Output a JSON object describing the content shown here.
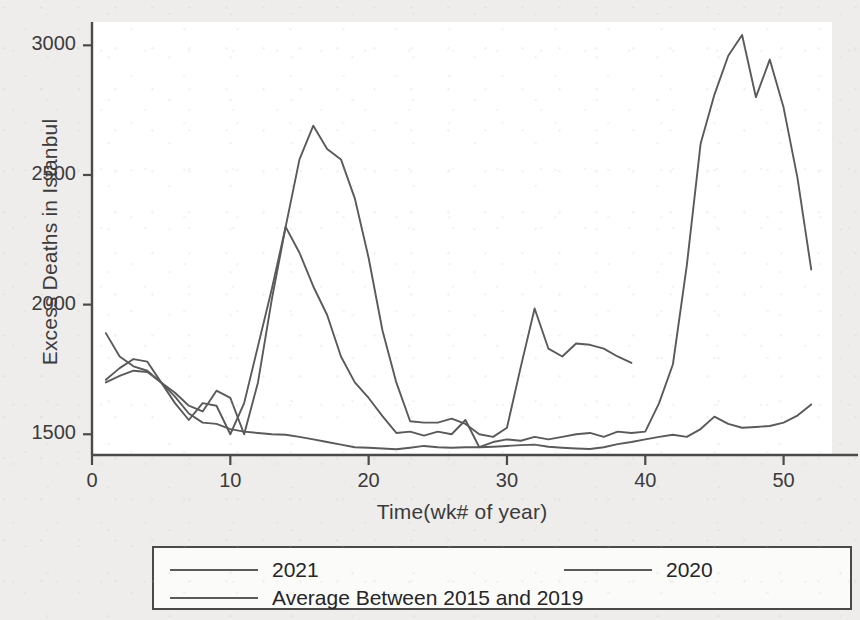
{
  "chart_data": {
    "type": "line",
    "title": "",
    "xlabel": "Time(wk# of year)",
    "ylabel": "Excess Deaths in Istanbul",
    "xlim": [
      0,
      53.5
    ],
    "ylim": [
      1420,
      3090
    ],
    "xticks": [
      0,
      10,
      20,
      30,
      40,
      50
    ],
    "xticklabels": [
      "0",
      "10",
      "20",
      "30",
      "40",
      "50"
    ],
    "yticks": [
      1500,
      2000,
      2500,
      3000
    ],
    "yticklabels": [
      "1500",
      "2000",
      "2500",
      "3000"
    ],
    "grid": false,
    "legend_position": "below-axes",
    "line_color": "#5a5a5a",
    "frame_color": "#4a4a4a",
    "plot_background": "#ffffff",
    "page_background": "#eeedeb",
    "series": [
      {
        "name": "2021",
        "x": [
          1,
          2,
          3,
          4,
          5,
          6,
          7,
          8,
          9,
          10,
          11,
          12,
          13,
          14,
          15,
          16,
          17,
          18,
          19,
          20,
          21,
          22,
          23,
          24,
          25,
          26,
          27,
          28,
          29,
          30,
          31,
          32,
          33,
          34,
          35,
          36,
          37,
          38,
          39
        ],
        "values": [
          1890,
          1800,
          1762,
          1745,
          1700,
          1660,
          1610,
          1588,
          1668,
          1640,
          1500,
          1700,
          2020,
          2300,
          2560,
          2690,
          2600,
          2560,
          2410,
          2180,
          1900,
          1700,
          1550,
          1545,
          1545,
          1560,
          1540,
          1500,
          1490,
          1525,
          1760,
          1985,
          1830,
          1800,
          1850,
          1845,
          1830,
          1800,
          1775
        ]
      },
      {
        "name": "2020",
        "x": [
          1,
          2,
          3,
          4,
          5,
          6,
          7,
          8,
          9,
          10,
          11,
          12,
          13,
          14,
          15,
          16,
          17,
          18,
          19,
          20,
          21,
          22,
          23,
          24,
          25,
          26,
          27,
          28,
          29,
          30,
          31,
          32,
          33,
          34,
          35,
          36,
          37,
          38,
          39,
          40,
          41,
          42,
          43,
          44,
          45,
          46,
          47,
          48,
          49,
          50,
          51,
          52
        ],
        "values": [
          1710,
          1755,
          1790,
          1780,
          1700,
          1620,
          1555,
          1620,
          1610,
          1500,
          1620,
          1840,
          2060,
          2300,
          2200,
          2070,
          1960,
          1800,
          1700,
          1640,
          1570,
          1505,
          1510,
          1495,
          1510,
          1500,
          1555,
          1450,
          1470,
          1480,
          1475,
          1490,
          1480,
          1490,
          1500,
          1505,
          1490,
          1510,
          1505,
          1510,
          1620,
          1770,
          2150,
          2620,
          2810,
          2960,
          3040,
          2800,
          2945,
          2760,
          2490,
          2135
        ]
      },
      {
        "name": "Average Between 2015 and 2019",
        "x": [
          1,
          2,
          3,
          4,
          5,
          6,
          7,
          8,
          9,
          10,
          11,
          12,
          13,
          14,
          15,
          16,
          17,
          18,
          19,
          20,
          21,
          22,
          23,
          24,
          25,
          26,
          27,
          28,
          29,
          30,
          31,
          32,
          33,
          34,
          35,
          36,
          37,
          38,
          39,
          40,
          41,
          42,
          43,
          44,
          45,
          46,
          47,
          48,
          49,
          50,
          51,
          52
        ],
        "values": [
          1700,
          1725,
          1745,
          1740,
          1700,
          1645,
          1580,
          1545,
          1540,
          1520,
          1510,
          1505,
          1500,
          1498,
          1490,
          1480,
          1470,
          1460,
          1450,
          1448,
          1445,
          1442,
          1448,
          1455,
          1450,
          1448,
          1450,
          1450,
          1452,
          1455,
          1458,
          1460,
          1452,
          1448,
          1445,
          1443,
          1450,
          1462,
          1470,
          1480,
          1490,
          1498,
          1490,
          1520,
          1568,
          1540,
          1525,
          1528,
          1532,
          1545,
          1572,
          1615
        ]
      }
    ]
  },
  "legend": {
    "entries": [
      {
        "label": "2021"
      },
      {
        "label": "2020"
      },
      {
        "label": "Average Between 2015 and 2019"
      }
    ]
  }
}
